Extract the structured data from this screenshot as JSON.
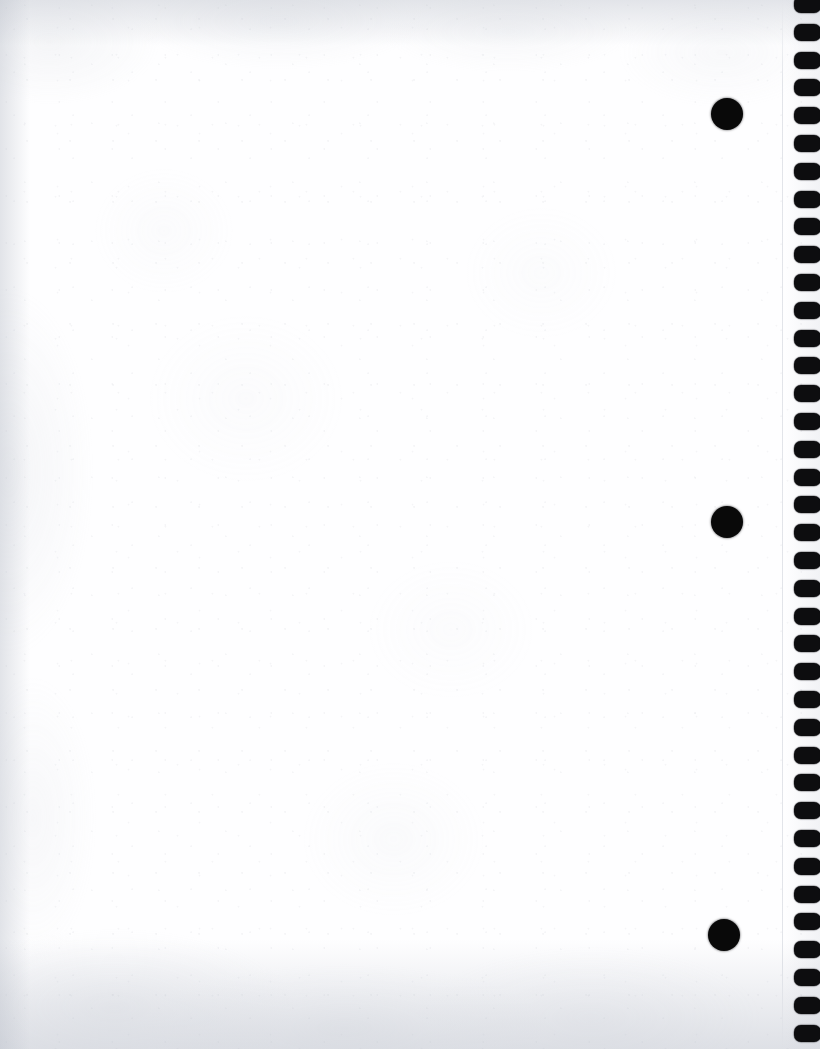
{
  "page": {
    "width": 820,
    "height": 1049,
    "content_text": ""
  },
  "colors": {
    "paper": "#fefeff",
    "hole": "#0d0d0f",
    "punch_dot": "#090909",
    "edge_shadow": "#b9bec8"
  },
  "binding": {
    "label": "spiral-binding-holes",
    "side": "right",
    "hole_count": 38,
    "hole_width": 27,
    "hole_height": 17,
    "hole_radius": 7,
    "strip_left": 792,
    "first_hole_y": -4,
    "spacing": 27.8
  },
  "punch_dots": {
    "label": "three-hole-punch-marks",
    "diameter": 32,
    "items": [
      {
        "name": "punch-dot-top",
        "cx": 727,
        "cy": 114
      },
      {
        "name": "punch-dot-middle",
        "cx": 727,
        "cy": 522
      },
      {
        "name": "punch-dot-bottom",
        "cx": 724,
        "cy": 935
      }
    ]
  }
}
